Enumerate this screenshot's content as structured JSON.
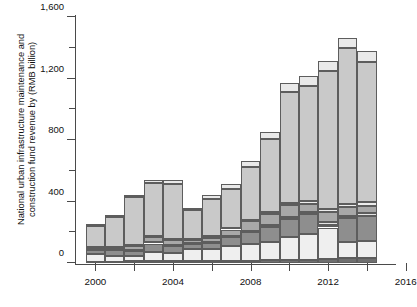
{
  "chart_data": {
    "type": "bar",
    "subtype": "stacked-bar",
    "title": "",
    "xlabel": "",
    "ylabel": "National urban infrastructure maintenance and\nconstruction fund revenue by (RMB billion)",
    "ylabel_full": "National urban infrastructure maintenance and construction fund revenue by source (RMB billion)",
    "ylim": [
      0,
      1600
    ],
    "xlim": [
      1999.5,
      2016
    ],
    "grid": false,
    "legend": "none",
    "y_ticks_major": [
      0,
      400,
      800,
      1200,
      1600
    ],
    "y_tick_labels": [
      "0",
      "400",
      "800",
      "1,200",
      "1,600"
    ],
    "y_ticks_minor": [
      200,
      600,
      1000,
      1400
    ],
    "x_ticks": [
      2000,
      2002,
      2004,
      2006,
      2008,
      2010,
      2012,
      2014,
      2016
    ],
    "x_tick_labels_shown": [
      "2000",
      "2004",
      "2008",
      "2012",
      "2016"
    ],
    "x_tick_label_values": [
      2000,
      2004,
      2008,
      2012,
      2016
    ],
    "categories": [
      2000,
      2001,
      2002,
      2003,
      2004,
      2005,
      2006,
      2007,
      2008,
      2009,
      2010,
      2011,
      2012,
      2013,
      2014
    ],
    "series": [
      {
        "name": "Source A (bottom, dark)",
        "color": "#6f6f6f",
        "values": [
          8,
          9,
          10,
          11,
          12,
          13,
          14,
          15,
          16,
          17,
          19,
          22,
          26,
          30,
          30
        ]
      },
      {
        "name": "Source B (very light)",
        "color": "#efefef",
        "values": [
          52,
          35,
          38,
          58,
          54,
          78,
          76,
          93,
          105,
          120,
          150,
          165,
          205,
          108,
          116
        ]
      },
      {
        "name": "Source C (mid-dark)",
        "color": "#8e8e8e",
        "values": [
          22,
          38,
          28,
          58,
          44,
          30,
          38,
          60,
          78,
          98,
          116,
          130,
          18,
          152,
          160
        ]
      },
      {
        "name": "Source D (thin light)",
        "color": "#e4e4e4",
        "values": [
          6,
          7,
          8,
          9,
          10,
          8,
          9,
          10,
          12,
          13,
          14,
          15,
          16,
          18,
          18
        ]
      },
      {
        "name": "Source E (medium)",
        "color": "#a8a8a8",
        "values": [
          10,
          12,
          26,
          32,
          28,
          20,
          28,
          40,
          60,
          70,
          76,
          54,
          66,
          56,
          50
        ]
      },
      {
        "name": "Source F (thin pale)",
        "color": "#ededed",
        "values": [
          5,
          6,
          7,
          8,
          9,
          8,
          9,
          10,
          12,
          14,
          16,
          18,
          20,
          22,
          22
        ]
      },
      {
        "name": "Source G (large light-gray)",
        "color": "#c9c9c9",
        "values": [
          140,
          190,
          310,
          345,
          360,
          185,
          245,
          255,
          340,
          475,
          720,
          750,
          900,
          1010,
          910
        ]
      },
      {
        "name": "Source H (top pale cap)",
        "color": "#e9e9e9",
        "values": [
          12,
          15,
          18,
          20,
          23,
          18,
          25,
          32,
          42,
          48,
          58,
          61,
          65,
          70,
          70
        ]
      }
    ],
    "totals": [
      255,
      312,
      445,
      541,
      540,
      360,
      444,
      515,
      665,
      855,
      1169,
      1215,
      1316,
      1466,
      1376
    ]
  },
  "axes": {
    "y_axis_name": "y-axis",
    "x_axis_name": "x-axis"
  }
}
